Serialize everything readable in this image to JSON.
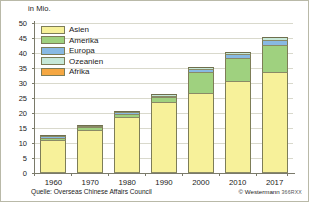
{
  "unit_label": "in Mio.",
  "source_text": "Quelle: Overseas Chinese Affairs Council",
  "copyright_text": "© Westermann",
  "copyright_code": "366RXX",
  "legend": {
    "items": [
      {
        "label": "Asien",
        "color": "#f7f19a"
      },
      {
        "label": "Amerika",
        "color": "#9fd17f"
      },
      {
        "label": "Europa",
        "color": "#88b9e3"
      },
      {
        "label": "Ozeanien",
        "color": "#c6e8d8"
      },
      {
        "label": "Afrika",
        "color": "#f5a742"
      }
    ]
  },
  "chart_data": {
    "type": "bar",
    "title": "",
    "subtitle": "",
    "xlabel": "",
    "ylabel": "in Mio.",
    "ylim": [
      0,
      50
    ],
    "ytick_step": 5,
    "yticks": [
      0,
      5,
      10,
      15,
      20,
      25,
      30,
      35,
      40,
      45,
      50
    ],
    "grid": true,
    "legend_position": "top-left-inside",
    "stacked": true,
    "categories": [
      "1960",
      "1970",
      "1980",
      "1990",
      "2000",
      "2010",
      "2017"
    ],
    "series": [
      {
        "name": "Asien",
        "color": "#f7f19a",
        "values": [
          10.8,
          14.1,
          18.2,
          23.2,
          26.5,
          30.5,
          33.5
        ]
      },
      {
        "name": "Amerika",
        "color": "#9fd17f",
        "values": [
          0.7,
          0.8,
          1.3,
          1.9,
          6.8,
          7.6,
          9.0
        ]
      },
      {
        "name": "Europa",
        "color": "#88b9e3",
        "values": [
          0.05,
          0.1,
          0.2,
          0.4,
          1.0,
          1.2,
          1.6
        ]
      },
      {
        "name": "Ozeanien",
        "color": "#c6e8d8",
        "values": [
          0.03,
          0.05,
          0.1,
          0.2,
          0.6,
          0.8,
          1.0
        ]
      },
      {
        "name": "Afrika",
        "color": "#f5a742",
        "values": [
          0.02,
          0.03,
          0.05,
          0.1,
          0.2,
          0.3,
          0.4
        ]
      }
    ],
    "totals": [
      11.6,
      15.1,
      19.9,
      25.8,
      35.1,
      40.4,
      45.5
    ]
  }
}
